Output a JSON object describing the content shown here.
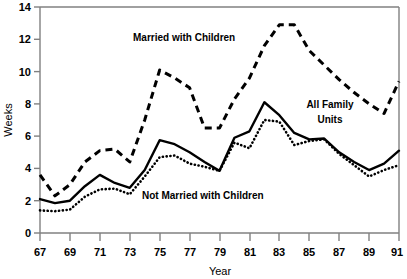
{
  "chart_data": {
    "type": "line",
    "title": "",
    "xlabel": "Year",
    "ylabel": "Weeks",
    "xlim": [
      67,
      91
    ],
    "ylim": [
      0,
      14
    ],
    "ytick_labels": [
      "0",
      "2",
      "4",
      "6",
      "8",
      "10",
      "12",
      "14"
    ],
    "yticks": [
      0,
      2,
      4,
      6,
      8,
      10,
      12,
      14
    ],
    "xtick_labels": [
      "67",
      "69",
      "71",
      "73",
      "75",
      "77",
      "79",
      "81",
      "83",
      "85",
      "87",
      "89",
      "91"
    ],
    "xticks": [
      67,
      69,
      71,
      73,
      75,
      77,
      79,
      81,
      83,
      85,
      87,
      89,
      91
    ],
    "grid": false,
    "legend": "inline-annotations",
    "x": [
      67,
      68,
      69,
      70,
      71,
      72,
      73,
      74,
      75,
      76,
      77,
      78,
      79,
      80,
      81,
      82,
      83,
      84,
      85,
      86,
      87,
      88,
      89,
      90,
      91
    ],
    "series": [
      {
        "name": "Married with Children",
        "style": "dashed",
        "color": "#000000",
        "values": [
          3.6,
          2.3,
          3.0,
          4.4,
          5.1,
          5.2,
          4.4,
          7.0,
          10.1,
          9.6,
          9.0,
          6.5,
          6.5,
          8.3,
          9.6,
          11.6,
          12.9,
          12.9,
          11.3,
          10.4,
          9.5,
          8.7,
          8.0,
          7.4,
          9.4
        ]
      },
      {
        "name": "All Family Units",
        "style": "solid",
        "color": "#000000",
        "values": [
          2.1,
          1.85,
          2.0,
          2.9,
          3.6,
          3.1,
          2.8,
          3.9,
          5.75,
          5.5,
          5.0,
          4.4,
          3.85,
          5.9,
          6.3,
          8.1,
          7.3,
          6.2,
          5.8,
          5.85,
          5.0,
          4.4,
          3.9,
          4.3,
          5.1
        ]
      },
      {
        "name": "Not Married with Children",
        "style": "dotted",
        "color": "#000000",
        "values": [
          1.4,
          1.35,
          1.45,
          2.25,
          2.7,
          2.75,
          2.4,
          3.5,
          4.7,
          4.8,
          4.3,
          4.1,
          3.85,
          5.6,
          5.25,
          7.0,
          6.9,
          5.45,
          5.7,
          5.8,
          4.9,
          4.2,
          3.5,
          3.9,
          4.2
        ]
      }
    ],
    "annotations": [
      {
        "text": "Married with Children",
        "x": 75.5,
        "y": 12.1
      },
      {
        "text": "All Family Units",
        "x": 85.2,
        "y": 8.2
      },
      {
        "text": "Not Married with Children",
        "x": 80.0,
        "y": 2.35
      }
    ]
  },
  "axis": {
    "ylabel": "Weeks",
    "xlabel": "Year"
  },
  "annotations": {
    "married_with_children": "Married with Children",
    "all_family_line1": "All Family",
    "all_family_line2": "Units",
    "not_married_with_children": "Not Married with Children"
  },
  "ytick_0": "0",
  "ytick_2": "2",
  "ytick_4": "4",
  "ytick_6": "6",
  "ytick_8": "8",
  "ytick_10": "10",
  "ytick_12": "12",
  "ytick_14": "14",
  "xtick_67": "67",
  "xtick_69": "69",
  "xtick_71": "71",
  "xtick_73": "73",
  "xtick_75": "75",
  "xtick_77": "77",
  "xtick_79": "79",
  "xtick_81": "81",
  "xtick_83": "83",
  "xtick_85": "85",
  "xtick_87": "87",
  "xtick_89": "89",
  "xtick_91": "91"
}
